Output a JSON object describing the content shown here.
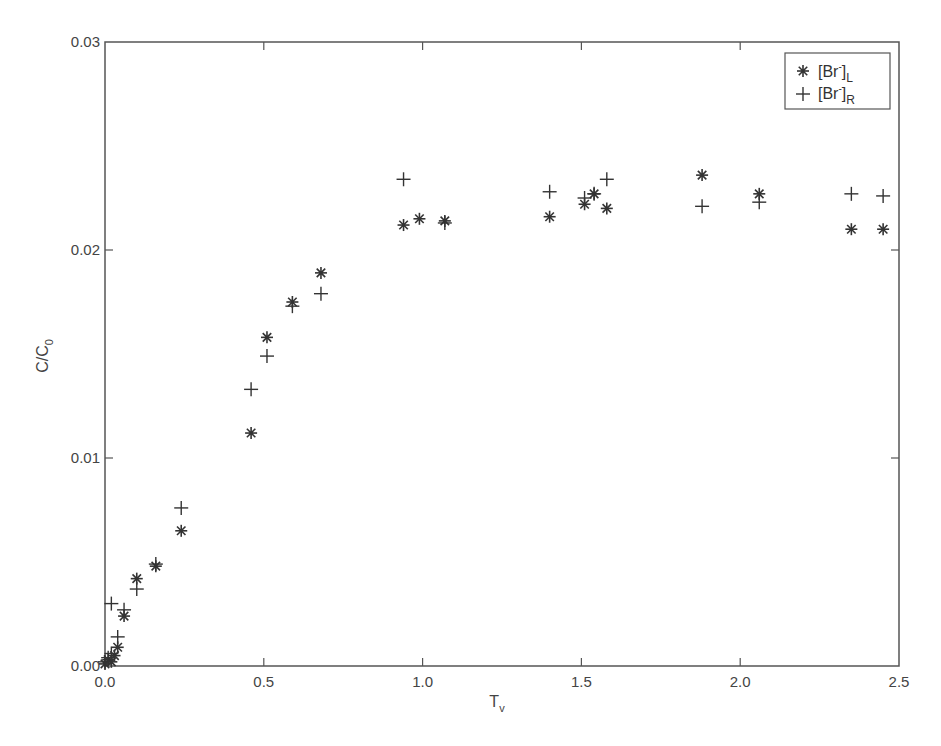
{
  "chart_data": {
    "type": "scatter",
    "title": "",
    "xlabel": "T",
    "xlabel_sub": "v",
    "ylabel": "C/C",
    "ylabel_sub": "0",
    "xlim": [
      0.0,
      2.5
    ],
    "ylim": [
      0.0,
      0.03
    ],
    "xticks": [
      0.0,
      0.5,
      1.0,
      1.5,
      2.0,
      2.5
    ],
    "xtick_labels": [
      "0.0",
      "0.5",
      "1.0",
      "1.5",
      "2.0",
      "2.5"
    ],
    "yticks": [
      0.0,
      0.01,
      0.02,
      0.03
    ],
    "ytick_labels": [
      "0.00",
      "0.01",
      "0.02",
      "0.03"
    ],
    "grid": false,
    "legend_position": "upper right",
    "series": [
      {
        "name": "[Br-]L",
        "label_main": "[Br",
        "label_sup": "-",
        "label_close": "]",
        "label_sub": "L",
        "marker": "asterisk",
        "x": [
          0.0,
          0.01,
          0.02,
          0.03,
          0.04,
          0.06,
          0.1,
          0.16,
          0.24,
          0.46,
          0.51,
          0.59,
          0.68,
          0.94,
          0.99,
          1.07,
          1.4,
          1.51,
          1.54,
          1.58,
          1.88,
          2.06,
          2.35,
          2.45
        ],
        "y": [
          0.0001,
          0.0003,
          0.0002,
          0.0005,
          0.0009,
          0.0024,
          0.0042,
          0.0048,
          0.0065,
          0.0112,
          0.0158,
          0.0175,
          0.0189,
          0.0212,
          0.0215,
          0.0214,
          0.0216,
          0.0222,
          0.0227,
          0.022,
          0.0236,
          0.0227,
          0.021,
          0.021
        ]
      },
      {
        "name": "[Br-]R",
        "label_main": "[Br",
        "label_sup": "-",
        "label_close": "]",
        "label_sub": "R",
        "marker": "plus",
        "x": [
          0.0,
          0.01,
          0.02,
          0.02,
          0.04,
          0.06,
          0.1,
          0.16,
          0.24,
          0.46,
          0.51,
          0.59,
          0.68,
          0.94,
          1.07,
          1.4,
          1.51,
          1.54,
          1.58,
          1.88,
          2.06,
          2.35,
          2.45
        ],
        "y": [
          0.0002,
          0.0004,
          0.0006,
          0.003,
          0.0014,
          0.0027,
          0.0037,
          0.0049,
          0.0076,
          0.0133,
          0.0149,
          0.0173,
          0.0179,
          0.0234,
          0.0213,
          0.0228,
          0.0225,
          0.0227,
          0.0234,
          0.0221,
          0.0223,
          0.0227,
          0.0226
        ]
      }
    ]
  },
  "colors": {
    "axis": "#555555",
    "marker": "#333333",
    "background": "#ffffff"
  }
}
